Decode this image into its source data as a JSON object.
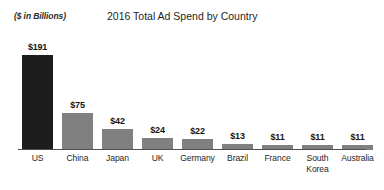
{
  "header": {
    "unit_label": "($ in Billions)",
    "title": "2016 Total Ad Spend by Country"
  },
  "chart_data": {
    "type": "bar",
    "title": "2016 Total Ad Spend by Country",
    "subtitle": "($ in Billions)",
    "xlabel": "",
    "ylabel": "($ in Billions)",
    "ylim": [
      0,
      191
    ],
    "grid": false,
    "legend": "none",
    "axis_color": "#4f4f4f",
    "categories": [
      "US",
      "China",
      "Japan",
      "UK",
      "Germany",
      "Brazil",
      "France",
      "South Korea",
      "Australia"
    ],
    "values": [
      191,
      75,
      42,
      24,
      22,
      13,
      11,
      11,
      11
    ],
    "value_labels": [
      "$191",
      "$75",
      "$42",
      "$24",
      "$22",
      "$13",
      "$11",
      "$11",
      "$11"
    ],
    "bar_colors": [
      "#1d1d1d",
      "#808080",
      "#808080",
      "#808080",
      "#808080",
      "#808080",
      "#808080",
      "#808080",
      "#808080"
    ],
    "category_lines": [
      [
        "US"
      ],
      [
        "China"
      ],
      [
        "Japan"
      ],
      [
        "UK"
      ],
      [
        "Germany"
      ],
      [
        "Brazil"
      ],
      [
        "France"
      ],
      [
        "South",
        "Korea"
      ],
      [
        "Australia"
      ]
    ]
  }
}
